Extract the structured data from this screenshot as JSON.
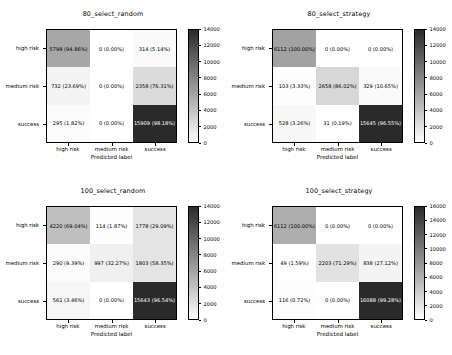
{
  "figure": {
    "xlabel": "Predicted label",
    "class_labels": [
      "high risk",
      "medium risk",
      "success"
    ],
    "colormap": "greys"
  },
  "chart_data": [
    {
      "type": "heatmap",
      "title": "80_select_random",
      "xlabel": "Predicted label",
      "ylabel": "",
      "categories_x": [
        "high risk",
        "medium risk",
        "success"
      ],
      "categories_y": [
        "high risk",
        "medium risk",
        "success"
      ],
      "values": [
        [
          5798,
          0,
          314
        ],
        [
          732,
          0,
          2358
        ],
        [
          295,
          0,
          15909
        ]
      ],
      "annotations": [
        [
          "5798 (94.86%)",
          "0 (0.00%)",
          "314 (5.14%)"
        ],
        [
          "732 (23.69%)",
          "0 (0.00%)",
          "2358 (76.31%)"
        ],
        [
          "295 (1.82%)",
          "0 (0.00%)",
          "15909 (98.18%)"
        ]
      ],
      "colorbar": {
        "min": 0,
        "max": 14000,
        "ticks": [
          0,
          2000,
          4000,
          6000,
          8000,
          10000,
          12000,
          14000
        ]
      }
    },
    {
      "type": "heatmap",
      "title": "80_select_strategy",
      "xlabel": "Predicted label",
      "ylabel": "",
      "categories_x": [
        "high risk",
        "medium risk",
        "success"
      ],
      "categories_y": [
        "high risk",
        "medium risk",
        "success"
      ],
      "values": [
        [
          6112,
          0,
          0
        ],
        [
          103,
          2658,
          329
        ],
        [
          528,
          31,
          15645
        ]
      ],
      "annotations": [
        [
          "6112 (100.00%)",
          "0 (0.00%)",
          "0 (0.00%)"
        ],
        [
          "103 (3.33%)",
          "2658 (86.02%)",
          "329 (10.65%)"
        ],
        [
          "528 (3.26%)",
          "31 (0.19%)",
          "15645 (96.55%)"
        ]
      ],
      "colorbar": {
        "min": 0,
        "max": 14000,
        "ticks": [
          0,
          2000,
          4000,
          6000,
          8000,
          10000,
          12000,
          14000
        ]
      }
    },
    {
      "type": "heatmap",
      "title": "100_select_random",
      "xlabel": "Predicted label",
      "ylabel": "",
      "categories_x": [
        "high risk",
        "medium risk",
        "success"
      ],
      "categories_y": [
        "high risk",
        "medium risk",
        "success"
      ],
      "values": [
        [
          4220,
          114,
          1778
        ],
        [
          290,
          997,
          1803
        ],
        [
          561,
          0,
          15643
        ]
      ],
      "annotations": [
        [
          "4220 (69.04%)",
          "114 (1.87%)",
          "1778 (29.09%)"
        ],
        [
          "290 (9.39%)",
          "997 (32.27%)",
          "1803 (58.35%)"
        ],
        [
          "561 (3.46%)",
          "0 (0.00%)",
          "15643 (96.54%)"
        ]
      ],
      "colorbar": {
        "min": 0,
        "max": 14000,
        "ticks": [
          0,
          2000,
          4000,
          6000,
          8000,
          10000,
          12000,
          14000
        ]
      }
    },
    {
      "type": "heatmap",
      "title": "100_select_strategy",
      "xlabel": "Predicted label",
      "ylabel": "",
      "categories_x": [
        "high risk",
        "medium risk",
        "success"
      ],
      "categories_y": [
        "high risk",
        "medium risk",
        "success"
      ],
      "values": [
        [
          6112,
          0,
          0
        ],
        [
          49,
          2203,
          838
        ],
        [
          116,
          0,
          16088
        ]
      ],
      "annotations": [
        [
          "6112 (100.00%)",
          "0 (0.00%)",
          "0 (0.00%)"
        ],
        [
          "49 (1.59%)",
          "2203 (71.29%)",
          "838 (27.12%)"
        ],
        [
          "116 (0.72%)",
          "0 (0.00%)",
          "16088 (99.28%)"
        ]
      ],
      "colorbar": {
        "min": 0,
        "max": 16000,
        "ticks": [
          0,
          2000,
          4000,
          6000,
          8000,
          10000,
          12000,
          14000,
          16000
        ]
      }
    }
  ]
}
